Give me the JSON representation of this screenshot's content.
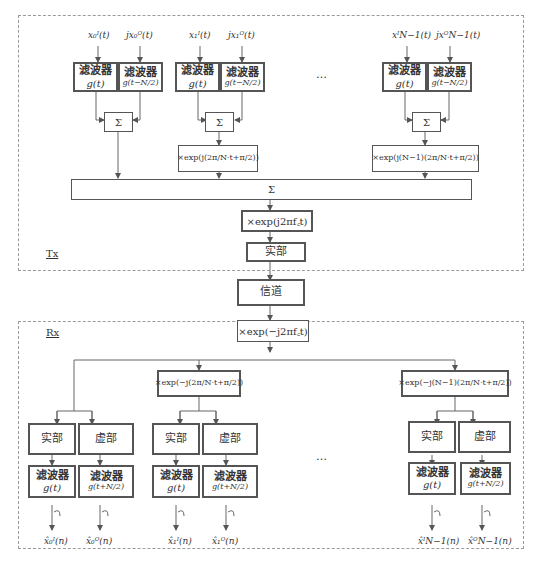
{
  "tx": {
    "label": "Tx",
    "branches": [
      {
        "in_i": "x₀ᴵ(t)",
        "in_q": "jx₀ᴼ(t)",
        "filter_label": "滤波器",
        "filter_i": "g(t)",
        "filter_q": "g(t−N/2)",
        "sum": "Σ",
        "modulator": ""
      },
      {
        "in_i": "x₁ᴵ(t)",
        "in_q": "jx₁ᴼ(t)",
        "filter_label": "滤波器",
        "filter_i": "g(t)",
        "filter_q": "g(t−N/2)",
        "sum": "Σ",
        "modulator": "×exp(j(2π/N·t+π/2))"
      },
      {
        "in_i": "xᴵN−1(t)",
        "in_q": "jxᴼN−1(t)",
        "filter_label": "滤波器",
        "filter_i": "g(t)",
        "filter_q": "g(t−N/2)",
        "sum": "Σ",
        "modulator": "×exp(j(N−1)(2π/N·t+π/2))"
      }
    ],
    "ellipsis": "…",
    "sum_all": "Σ",
    "carrier": "×exp(j2πf꜀t)",
    "real_part": "实部"
  },
  "channel": "信道",
  "rx": {
    "label": "Rx",
    "carrier": "×exp(−j2πf꜀t)",
    "ellipsis": "…",
    "branches": [
      {
        "demodulator": "",
        "real": "实部",
        "imag": "虚部",
        "filter_label": "滤波器",
        "filter_i": "g(t)",
        "filter_q": "g(t+N/2)",
        "out_i": "x̂₀ᴵ(n)",
        "out_q": "x̂₀ᴼ(n)"
      },
      {
        "demodulator": "×exp(−j(2π/N·t+π/2))",
        "real": "实部",
        "imag": "虚部",
        "filter_label": "滤波器",
        "filter_i": "g(t)",
        "filter_q": "g(t+N/2)",
        "out_i": "x̂₁ᴵ(n)",
        "out_q": "x̂₁ᴼ(n)"
      },
      {
        "demodulator": "×exp(−j(N−1)(2π/N·t+π/2))",
        "real": "实部",
        "imag": "虚部",
        "filter_label": "滤波器",
        "filter_i": "g(t)",
        "filter_q": "g(t+N/2)",
        "out_i": "x̂ᴵN−1(n)",
        "out_q": "x̂ᴼN−1(n)"
      }
    ]
  }
}
